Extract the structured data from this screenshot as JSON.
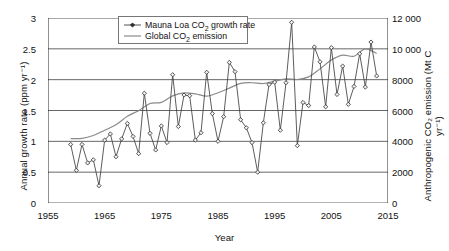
{
  "chart_data": {
    "type": "line",
    "title": "",
    "xlabel": "Year",
    "ylabel": "Annual growth rate (ppm yr⁻¹)",
    "ylabel_right": "Anthropogenic CO₂ emission (Mt C yr⁻¹)",
    "xlim": [
      1955,
      2015
    ],
    "ylim": [
      0,
      3
    ],
    "ylim_right": [
      0,
      12000
    ],
    "grid": true,
    "legend_position": "top-center",
    "xticks": [
      "1955",
      "1965",
      "1975",
      "1985",
      "1995",
      "2005",
      "2015"
    ],
    "xtick_values": [
      1955,
      1965,
      1975,
      1985,
      1995,
      2005,
      2015
    ],
    "yticks_left": [
      "0",
      "0.5",
      "1",
      "1.5",
      "2",
      "2.5",
      "3"
    ],
    "ytick_values_left": [
      0,
      0.5,
      1,
      1.5,
      2,
      2.5,
      3
    ],
    "yticks_right": [
      "0",
      "2000",
      "4000",
      "6000",
      "8000",
      "10 000",
      "12 000"
    ],
    "ytick_values_right": [
      0,
      2000,
      4000,
      6000,
      8000,
      10000,
      12000
    ],
    "series": [
      {
        "name": "Mauna Loa CO₂ growth rate",
        "axis": "left",
        "units": "ppm yr-1",
        "marker": "diamond",
        "x": [
          1959,
          1960,
          1961,
          1962,
          1963,
          1964,
          1965,
          1966,
          1967,
          1968,
          1969,
          1970,
          1971,
          1972,
          1973,
          1974,
          1975,
          1976,
          1977,
          1978,
          1979,
          1980,
          1981,
          1982,
          1983,
          1984,
          1985,
          1986,
          1987,
          1988,
          1989,
          1990,
          1991,
          1992,
          1993,
          1994,
          1995,
          1996,
          1997,
          1998,
          1999,
          2000,
          2001,
          2002,
          2003,
          2004,
          2005,
          2006,
          2007,
          2008,
          2009,
          2010,
          2011,
          2012,
          2013
        ],
        "values": [
          0.95,
          0.53,
          0.95,
          0.65,
          0.7,
          0.28,
          1.02,
          1.12,
          0.75,
          1.04,
          1.29,
          1.08,
          0.8,
          1.78,
          1.13,
          0.86,
          1.25,
          0.98,
          2.08,
          1.24,
          1.75,
          1.74,
          1.02,
          1.14,
          2.12,
          1.45,
          1.0,
          1.4,
          2.28,
          2.13,
          1.35,
          1.22,
          0.98,
          0.5,
          1.3,
          1.92,
          1.96,
          1.18,
          1.95,
          2.93,
          0.93,
          1.63,
          1.58,
          2.53,
          2.29,
          1.56,
          2.52,
          1.76,
          2.22,
          1.6,
          1.89,
          2.42,
          1.88,
          2.61,
          2.06
        ],
        "color": "#404040"
      },
      {
        "name": "Global CO₂ emission",
        "axis": "right",
        "units": "Mt C yr-1",
        "marker": "none",
        "x": [
          1959,
          1961,
          1963,
          1965,
          1967,
          1969,
          1971,
          1973,
          1975,
          1977,
          1979,
          1981,
          1983,
          1985,
          1987,
          1989,
          1991,
          1993,
          1995,
          1997,
          1999,
          2001,
          2003,
          2005,
          2007,
          2009,
          2011,
          2013
        ],
        "values": [
          4180,
          4190,
          4380,
          4720,
          5080,
          5630,
          5990,
          6450,
          6530,
          6950,
          7140,
          7080,
          6930,
          7150,
          7450,
          7760,
          7800,
          7750,
          7900,
          8050,
          8010,
          8180,
          8700,
          9270,
          9590,
          9520,
          10000,
          9700
        ],
        "color": "#8a8a8a"
      }
    ]
  },
  "legend": {
    "items": [
      {
        "label": "Mauna Loa CO₂ growth rate",
        "style": "line-marker"
      },
      {
        "label": "Global CO₂ emission",
        "style": "line"
      }
    ]
  }
}
